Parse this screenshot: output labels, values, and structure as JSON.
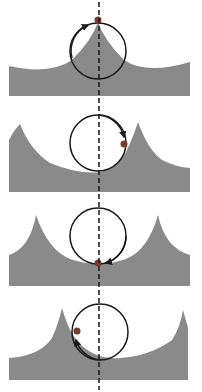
{
  "diagram": {
    "colors": {
      "ground": "#8a8a8a",
      "circle": "#1a1a1a",
      "dot": "#7a3b2e",
      "dashed_line": "#1a1a1a",
      "background": "#ffffff"
    },
    "panels": [
      {
        "index": 1,
        "dot_position": "top of circle",
        "arrow_direction": "clockwise toward top"
      },
      {
        "index": 2,
        "dot_position": "right side of circle",
        "arrow_direction": "clockwise toward right"
      },
      {
        "index": 3,
        "dot_position": "bottom of circle",
        "arrow_direction": "clockwise toward bottom"
      },
      {
        "index": 4,
        "dot_position": "left side of circle",
        "arrow_direction": "clockwise toward left"
      }
    ]
  }
}
